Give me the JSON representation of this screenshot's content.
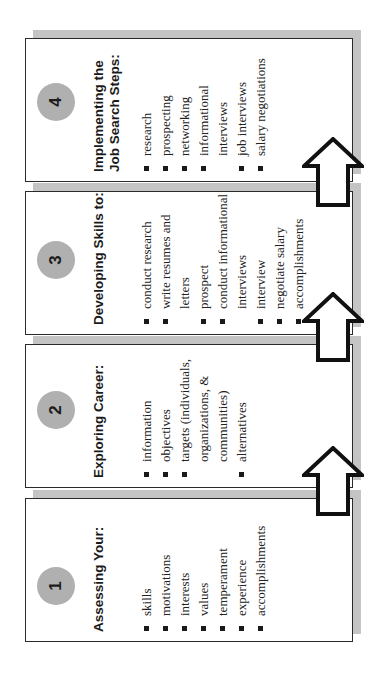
{
  "diagram": {
    "orientation": "rotated -90deg",
    "colors": {
      "box_border": "#2a2a2a",
      "box_shadow": "#c4c4c4",
      "circle_fill": "#b0b0b0",
      "number_text": "#1c1c1c",
      "arrow_stroke": "#111111",
      "arrow_fill": "#ffffff"
    },
    "steps": [
      {
        "number": "1",
        "heading_lines": [
          "Assessing Your:"
        ],
        "items": [
          {
            "lines": [
              "skills"
            ]
          },
          {
            "lines": [
              "motivations"
            ]
          },
          {
            "lines": [
              "interests"
            ]
          },
          {
            "lines": [
              "values"
            ]
          },
          {
            "lines": [
              "temperament"
            ]
          },
          {
            "lines": [
              "experience"
            ]
          },
          {
            "lines": [
              "accomplishments"
            ]
          }
        ]
      },
      {
        "number": "2",
        "heading_lines": [
          "Exploring Career:"
        ],
        "items": [
          {
            "lines": [
              "information"
            ]
          },
          {
            "lines": [
              "objectives"
            ]
          },
          {
            "lines": [
              "targets (individuals,",
              "organizations, &",
              "communities)"
            ]
          },
          {
            "lines": [
              "alternatives"
            ]
          }
        ]
      },
      {
        "number": "3",
        "heading_lines": [
          "Developing Skills to:"
        ],
        "items": [
          {
            "lines": [
              "conduct research"
            ]
          },
          {
            "lines": [
              "write resumes and",
              "letters"
            ]
          },
          {
            "lines": [
              "prospect"
            ]
          },
          {
            "lines": [
              "conduct informational",
              "interviews"
            ]
          },
          {
            "lines": [
              "interview"
            ]
          },
          {
            "lines": [
              "negotiate salary"
            ]
          },
          {
            "lines": [
              "accomplishments"
            ]
          }
        ]
      },
      {
        "number": "4",
        "heading_lines": [
          "Implementing the",
          "Job Search Steps:"
        ],
        "items": [
          {
            "lines": [
              "research"
            ]
          },
          {
            "lines": [
              "prospecting"
            ]
          },
          {
            "lines": [
              "networking"
            ]
          },
          {
            "lines": [
              "informational",
              "interviews"
            ]
          },
          {
            "lines": [
              "job interviews"
            ]
          },
          {
            "lines": [
              "salary negotiations"
            ]
          }
        ]
      }
    ],
    "connectors": [
      {
        "from": "1",
        "to": "2",
        "direction": "next-step"
      },
      {
        "from": "2",
        "to": "3",
        "direction": "next-step"
      },
      {
        "from": "3",
        "to": "4",
        "direction": "next-step"
      }
    ]
  }
}
